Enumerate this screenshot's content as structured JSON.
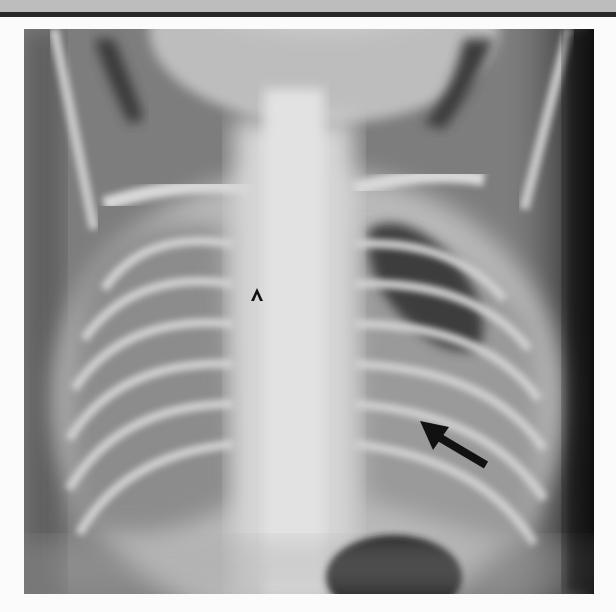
{
  "figure": {
    "type": "chest-radiograph",
    "view": "frontal",
    "annotations": [
      {
        "kind": "caret-marker",
        "glyph": "^",
        "x": 257,
        "y": 292
      },
      {
        "kind": "arrow",
        "direction": "up-left",
        "tip": [
          421,
          423
        ],
        "tail": [
          486,
          465
        ]
      }
    ],
    "colors": {
      "frame_top_band": "#bdbdbd",
      "frame_rule": "#2a2a2a",
      "background": "#fbfbfb",
      "annotation": "#111111"
    }
  }
}
